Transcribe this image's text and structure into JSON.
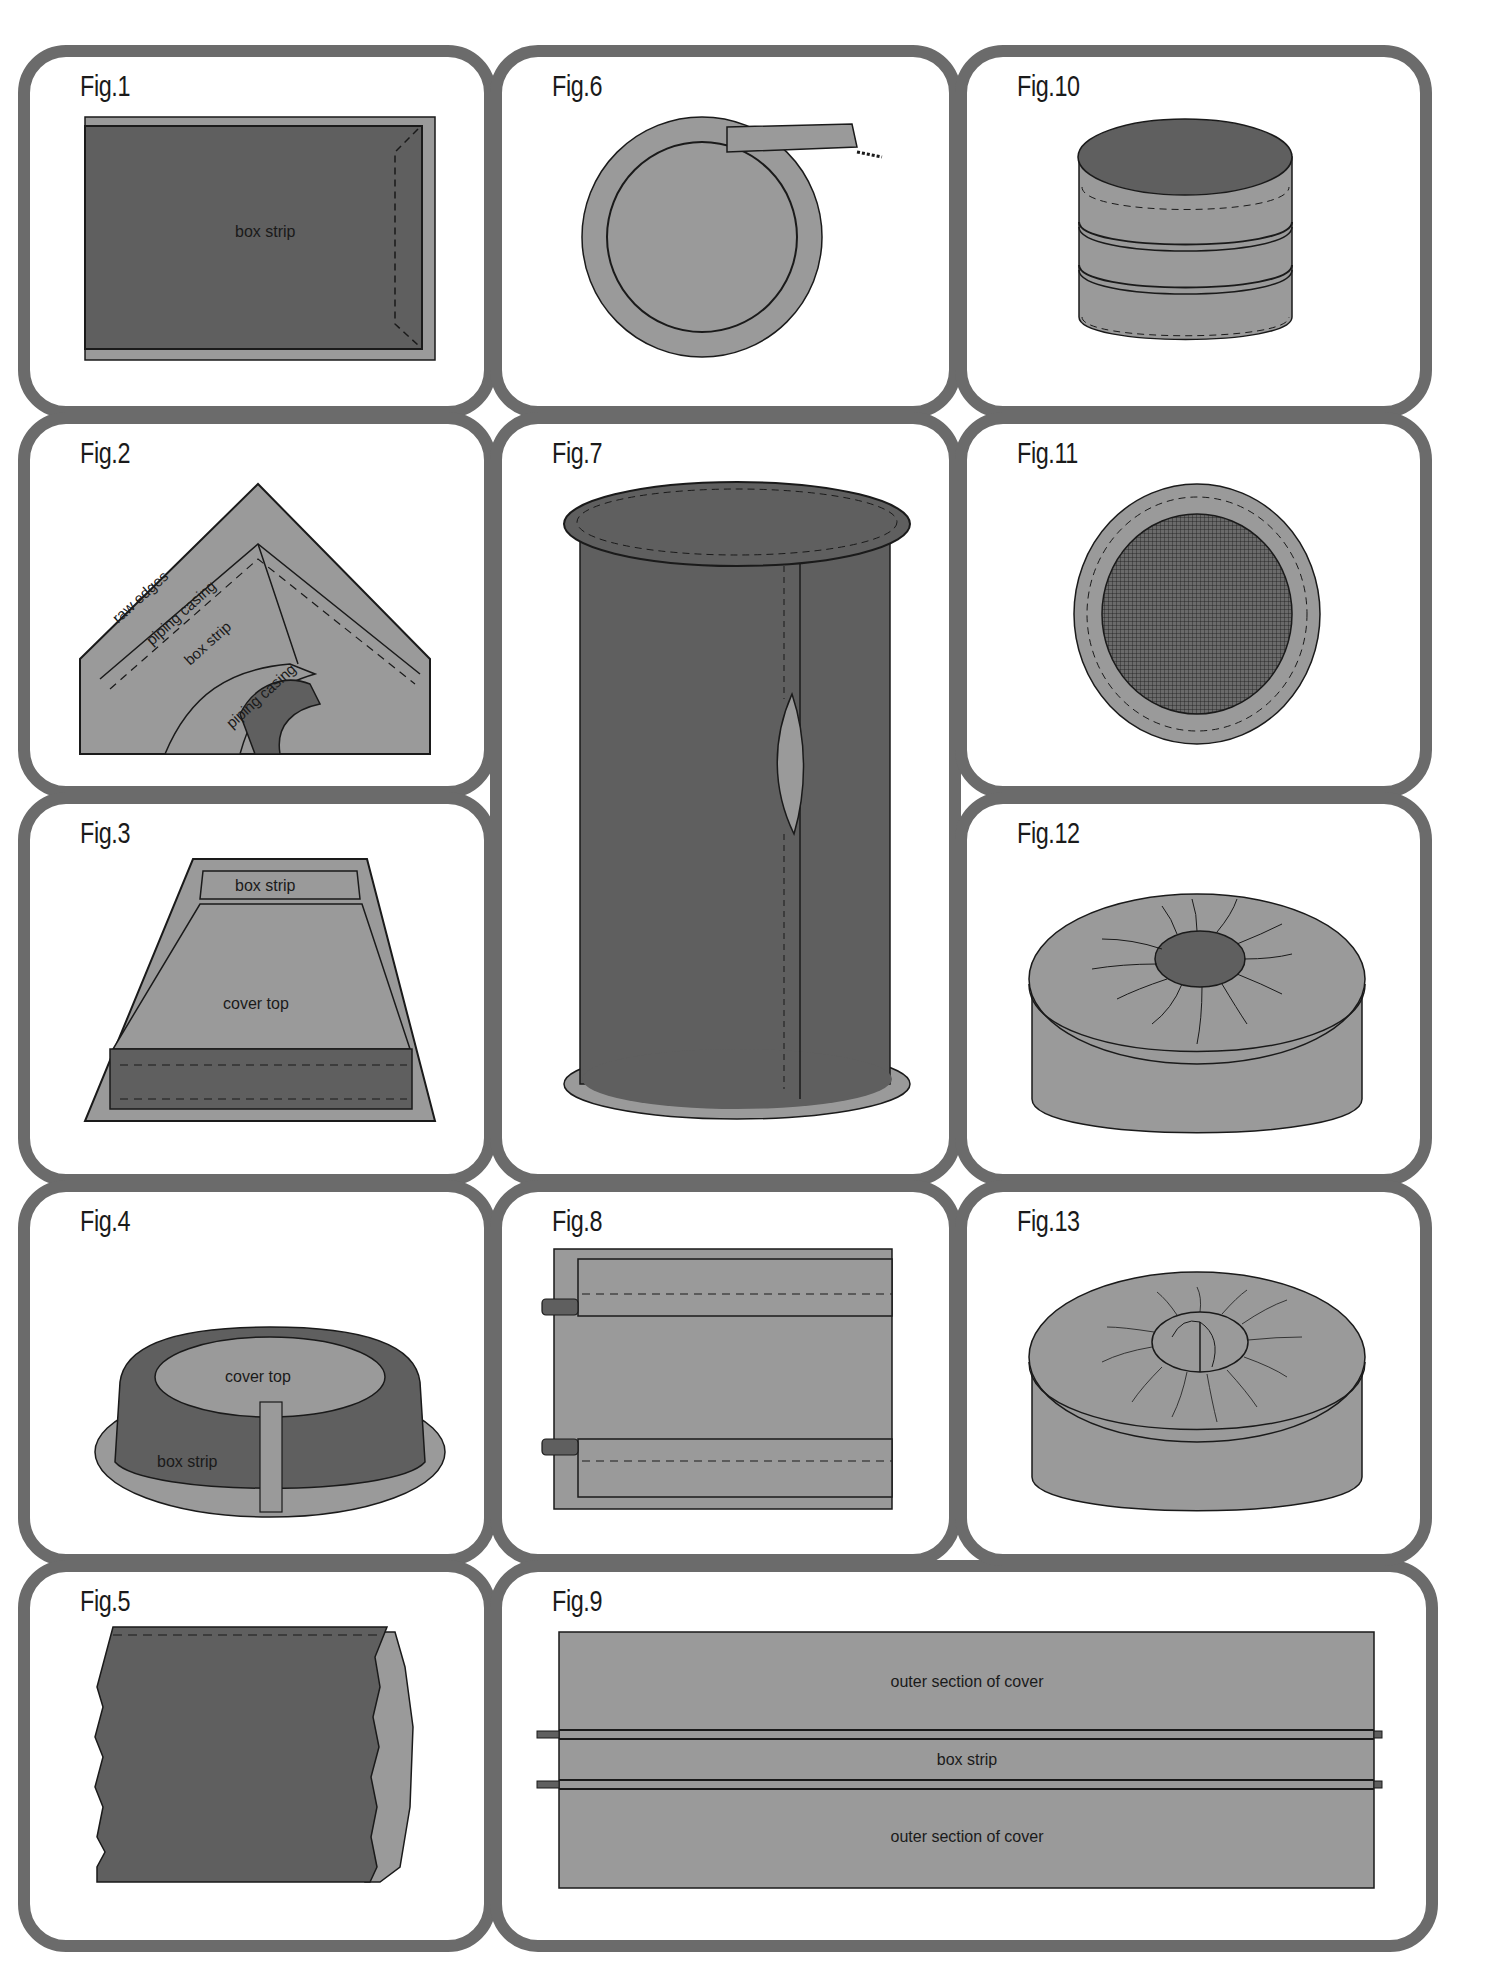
{
  "colors": {
    "border": "#6b6b6b",
    "dark_fabric": "#5f5f5f",
    "light_fabric": "#9a9a9a",
    "outline": "#1a1a1a",
    "background": "#ffffff"
  },
  "figures": [
    {
      "id": "fig1",
      "label": "Fig.1",
      "annotations": [
        "box strip"
      ]
    },
    {
      "id": "fig2",
      "label": "Fig.2",
      "annotations": [
        "raw edges",
        "piping casing",
        "box strip",
        "piping casing"
      ]
    },
    {
      "id": "fig3",
      "label": "Fig.3",
      "annotations": [
        "box strip",
        "cover top"
      ]
    },
    {
      "id": "fig4",
      "label": "Fig.4",
      "annotations": [
        "cover top",
        "box strip"
      ]
    },
    {
      "id": "fig5",
      "label": "Fig.5",
      "annotations": []
    },
    {
      "id": "fig6",
      "label": "Fig.6",
      "annotations": []
    },
    {
      "id": "fig7",
      "label": "Fig.7",
      "annotations": []
    },
    {
      "id": "fig8",
      "label": "Fig.8",
      "annotations": []
    },
    {
      "id": "fig9",
      "label": "Fig.9",
      "annotations": [
        "outer section of cover",
        "box strip",
        "outer section of cover"
      ]
    },
    {
      "id": "fig10",
      "label": "Fig.10",
      "annotations": []
    },
    {
      "id": "fig11",
      "label": "Fig.11",
      "annotations": []
    },
    {
      "id": "fig12",
      "label": "Fig.12",
      "annotations": []
    },
    {
      "id": "fig13",
      "label": "Fig.13",
      "annotations": []
    }
  ]
}
